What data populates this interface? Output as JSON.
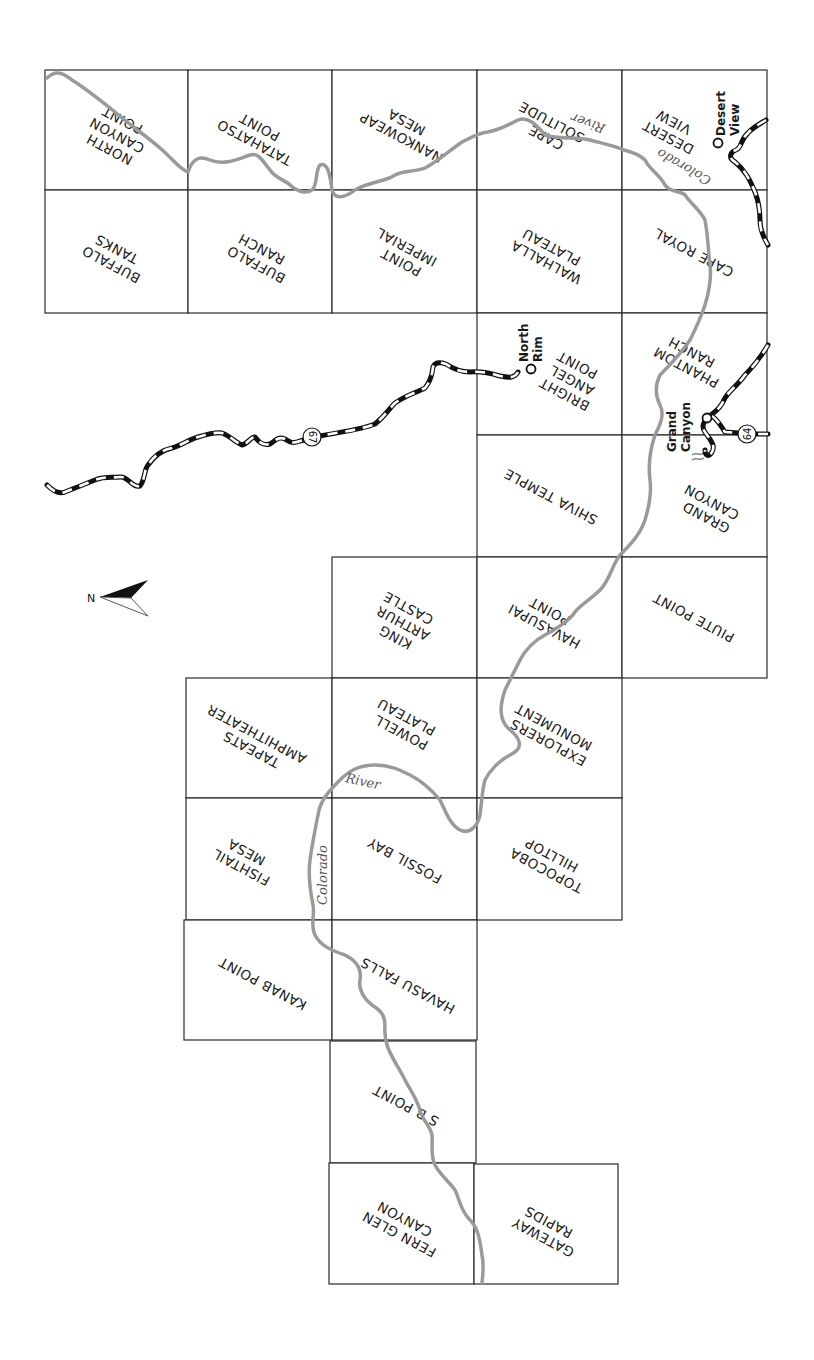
{
  "map": {
    "title": "Grand Canyon USGS 7.5' Quadrangle Index",
    "orientation_note": "rotated; north arrow points left",
    "north_arrow": {
      "label": "N",
      "icon": "north-arrow-icon"
    },
    "colors": {
      "grid": "#2a2a2a",
      "river": "#9a9a9a",
      "road": "#111111",
      "background": "#ffffff"
    },
    "tiles": [
      {
        "id": "north-canyon-point",
        "lines": [
          "NORTH",
          "CANYON",
          "POINT"
        ]
      },
      {
        "id": "tatahatso-point",
        "lines": [
          "TATAHATSO",
          "POINT"
        ]
      },
      {
        "id": "nankoweap-mesa",
        "lines": [
          "NANKOWEAP",
          "MESA"
        ]
      },
      {
        "id": "cape-solitude",
        "lines": [
          "CAPE",
          "SOLITUDE"
        ]
      },
      {
        "id": "desert-view",
        "lines": [
          "DESERT",
          "VIEW"
        ]
      },
      {
        "id": "buffalo-tanks",
        "lines": [
          "BUFFALO",
          "TANKS"
        ]
      },
      {
        "id": "buffalo-ranch",
        "lines": [
          "BUFFALO",
          "RANCH"
        ]
      },
      {
        "id": "point-imperial",
        "lines": [
          "POINT",
          "IMPERIAL"
        ]
      },
      {
        "id": "walhalla-plateau",
        "lines": [
          "WALHALLA",
          "PLATEAU"
        ]
      },
      {
        "id": "cape-royal",
        "lines": [
          "CAPE ROYAL"
        ]
      },
      {
        "id": "bright-angel-point",
        "lines": [
          "BRIGHT",
          "ANGEL",
          "POINT"
        ]
      },
      {
        "id": "phantom-ranch",
        "lines": [
          "PHANTOM",
          "RANCH"
        ]
      },
      {
        "id": "shiva-temple",
        "lines": [
          "SHIVA TEMPLE"
        ]
      },
      {
        "id": "grand-canyon",
        "lines": [
          "GRAND",
          "CANYON"
        ]
      },
      {
        "id": "king-arthur-castle",
        "lines": [
          "KING",
          "ARTHUR",
          "CASTLE"
        ]
      },
      {
        "id": "havasupai-point",
        "lines": [
          "HAVASUPAI",
          "POINT"
        ]
      },
      {
        "id": "piute-point",
        "lines": [
          "PIUTE POINT"
        ]
      },
      {
        "id": "tapeats-amphitheater",
        "lines": [
          "TAPEATS",
          "AMPHITHEATER"
        ]
      },
      {
        "id": "powell-plateau",
        "lines": [
          "POWELL",
          "PLATEAU"
        ]
      },
      {
        "id": "explorers-monument",
        "lines": [
          "EXPLORERS",
          "MONUMENT"
        ]
      },
      {
        "id": "fishtail-mesa",
        "lines": [
          "FISHTAIL",
          "MESA"
        ]
      },
      {
        "id": "fossil-bay",
        "lines": [
          "FOSSIL BAY"
        ]
      },
      {
        "id": "topocoba-hilltop",
        "lines": [
          "TOPOCOBA",
          "HILLTOP"
        ]
      },
      {
        "id": "kanab-point",
        "lines": [
          "KANAB POINT"
        ]
      },
      {
        "id": "havasu-falls",
        "lines": [
          "HAVASU FALLS"
        ]
      },
      {
        "id": "sb-point",
        "lines": [
          "S B POINT"
        ]
      },
      {
        "id": "fern-glen-canyon",
        "lines": [
          "FERN GLEN",
          "CANYON"
        ]
      },
      {
        "id": "gateway-rapids",
        "lines": [
          "GATEWAY",
          "RAPIDS"
        ]
      }
    ],
    "places": [
      {
        "id": "desert-view-place",
        "lines": [
          "Desert",
          "View"
        ]
      },
      {
        "id": "north-rim-place",
        "lines": [
          "North",
          "Rim"
        ]
      },
      {
        "id": "grand-canyon-place",
        "lines": [
          "Grand",
          "Canyon"
        ]
      }
    ],
    "river_labels": {
      "colorado_1": "Colorado",
      "river_1": "River",
      "colorado_2": "Colorado",
      "river_2": "River"
    },
    "routes": [
      {
        "id": "route-67",
        "number": "67"
      },
      {
        "id": "route-64",
        "number": "64"
      }
    ]
  }
}
